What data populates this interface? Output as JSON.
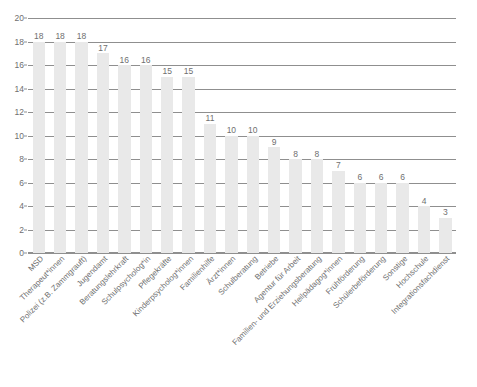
{
  "chart_data": {
    "type": "bar",
    "title": "",
    "subtitle": "",
    "xlabel": "",
    "ylabel": "",
    "ylim": [
      0,
      20
    ],
    "ytick_step": 2,
    "yticks": [
      0,
      2,
      4,
      6,
      8,
      10,
      12,
      14,
      16,
      18,
      20
    ],
    "grid": true,
    "legend": "none",
    "bar_color": "#e9e9e9",
    "gridline_color": "#8f8f8f",
    "text_color": "#6f6f6f",
    "label_rotation_deg": -45,
    "categories": [
      "MSD",
      "Therapeut*innen",
      "Polizei (z.B. Zammgrauft)",
      "Jugendamt",
      "Beratungslehrkraft",
      "Schulpsycholog*in",
      "Pflegekräfte",
      "Kinderpsycholog*innen",
      "Familienhilfe",
      "Ärzt*innen",
      "Schulberatung",
      "Betriebe",
      "Agentur für Arbeit",
      "Familien- und Erziehungsberatung",
      "Heilpädagog*innen",
      "Frühförderung",
      "Schülerbeförderung",
      "Sonstige",
      "Hochschule",
      "Integrationsfachdienst"
    ],
    "values": [
      18,
      18,
      18,
      17,
      16,
      16,
      15,
      15,
      11,
      10,
      10,
      9,
      8,
      8,
      7,
      6,
      6,
      6,
      4,
      3
    ],
    "data_labels": [
      "18",
      "18",
      "18",
      "17",
      "16",
      "16",
      "15",
      "15",
      "11",
      "10",
      "10",
      "9",
      "8",
      "8",
      "7",
      "6",
      "6",
      "6",
      "4",
      "3"
    ]
  },
  "caption": ""
}
